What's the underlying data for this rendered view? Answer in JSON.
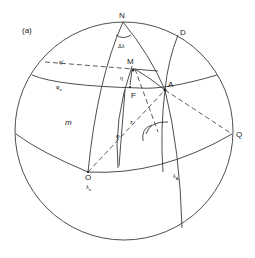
{
  "figure": {
    "panel_label": "(a)"
  },
  "labels": {
    "N": "N",
    "delta_lambda": "Δλ",
    "D": "D",
    "M": "M",
    "A": "A",
    "F": "F",
    "phi_prime": "φ'",
    "phi_o": "φ",
    "phi_o_sub": "o",
    "eta": "η",
    "m": "m",
    "phi": "φ",
    "z": "z",
    "O": "O",
    "lambda_o": "λ",
    "lambda_o_sub": "o",
    "lambda_A": "λ",
    "lambda_A_sub": "A",
    "Q": "Q"
  }
}
